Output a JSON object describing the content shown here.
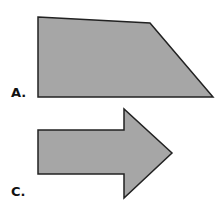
{
  "figure": {
    "colors": {
      "fill": "#a6a6a6",
      "stroke": "#222222",
      "background": "#ffffff"
    },
    "shapes": [
      {
        "id": "A",
        "label": "A.",
        "type": "trapezoid",
        "points": "38,17 150,23 213,97 38,97"
      },
      {
        "id": "C",
        "label": "C.",
        "type": "right-arrow",
        "points": "38,130 124,130 124,109 172,153 124,198 124,174 38,174"
      }
    ]
  }
}
